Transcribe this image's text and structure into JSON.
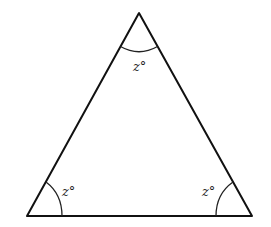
{
  "diagram": {
    "type": "equilateral-triangle",
    "vertices": {
      "top": {
        "x": 139,
        "y": 13
      },
      "bottom_left": {
        "x": 27,
        "y": 216
      },
      "bottom_right": {
        "x": 252,
        "y": 216
      }
    },
    "angles": {
      "top": {
        "label": "z°"
      },
      "bottom_left": {
        "label": "z°"
      },
      "bottom_right": {
        "label": "z°"
      }
    },
    "colors": {
      "stroke": "#111111",
      "background": "#ffffff"
    }
  }
}
